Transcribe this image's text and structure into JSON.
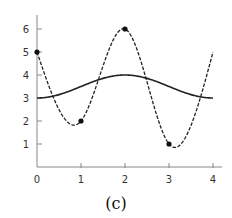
{
  "chart_data": {
    "type": "line",
    "title": "",
    "caption": "(c)",
    "xlabel": "",
    "ylabel": "",
    "xlim": [
      0,
      4
    ],
    "ylim": [
      0,
      6.5
    ],
    "grid": false,
    "legend": null,
    "x_ticks": [
      "0",
      "1",
      "2",
      "3",
      "4"
    ],
    "y_ticks": [
      "1",
      "2",
      "3",
      "4",
      "5",
      "6"
    ],
    "series": [
      {
        "name": "smooth curve (solid)",
        "style": "solid",
        "description": "y = 3.5 - 0.5*cos(pi*x/2)",
        "x": [
          0,
          0.5,
          1,
          1.5,
          2,
          2.5,
          3,
          3.5,
          4
        ],
        "values": [
          3.0,
          3.15,
          3.5,
          3.85,
          4.0,
          3.85,
          3.5,
          3.15,
          3.0
        ]
      },
      {
        "name": "interpolating spline (dashed)",
        "style": "dashed",
        "x": [
          0,
          1,
          2,
          3,
          4
        ],
        "values": [
          5,
          2,
          6,
          1,
          5
        ],
        "markers": [
          [
            0,
            5
          ],
          [
            1,
            2
          ],
          [
            2,
            6
          ],
          [
            3,
            1
          ]
        ]
      }
    ],
    "colors": {
      "line": "#222222",
      "axis": "#888888",
      "marker": "#111111"
    }
  }
}
